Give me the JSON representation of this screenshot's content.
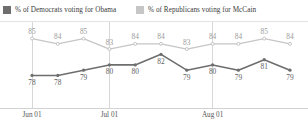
{
  "legend": {
    "position": "top-left",
    "items": [
      {
        "label": "% of Democrats voting for Obama",
        "color": "#6e6e6e",
        "swatch_name": "legend-swatch-democrats"
      },
      {
        "label": "% of Republicans voting for McCain",
        "color": "#c6c6c6",
        "swatch_name": "legend-swatch-republicans"
      }
    ]
  },
  "axis": {
    "ticks": [
      {
        "label": "Jun 01"
      },
      {
        "label": "Jul 01"
      },
      {
        "label": "Aug 01"
      }
    ]
  },
  "chart_data": {
    "type": "line",
    "title": "",
    "subtitle": "",
    "xlabel": "",
    "ylabel": "",
    "grid": true,
    "gridlines": [
      "Jun 01",
      "Jul 01",
      "Aug 01"
    ],
    "legend_position": "top-left",
    "x": [
      1,
      2,
      3,
      4,
      5,
      6,
      7,
      8,
      9,
      10,
      11
    ],
    "xtick_labels": [
      "Jun 01",
      "",
      "",
      "Jul 01",
      "",
      "",
      "",
      "Aug 01",
      "",
      "",
      ""
    ],
    "ylim": [
      76,
      87
    ],
    "series": [
      {
        "name": "% of Democrats voting for Obama",
        "color": "#6e6e6e",
        "values": [
          78,
          78,
          79,
          80,
          80,
          82,
          79,
          80,
          79,
          81,
          79
        ],
        "labels": [
          "78",
          "78",
          "79",
          "80",
          "80",
          "82",
          "79",
          "80",
          "79",
          "81",
          "79"
        ]
      },
      {
        "name": "% of Republicans voting for McCain",
        "color": "#c6c6c6",
        "values": [
          85,
          84,
          85,
          83,
          84,
          84,
          83,
          84,
          84,
          85,
          84
        ],
        "labels": [
          "85",
          "84",
          "85",
          "83",
          "84",
          "84",
          "83",
          "84",
          "84",
          "85",
          "84"
        ]
      }
    ]
  }
}
